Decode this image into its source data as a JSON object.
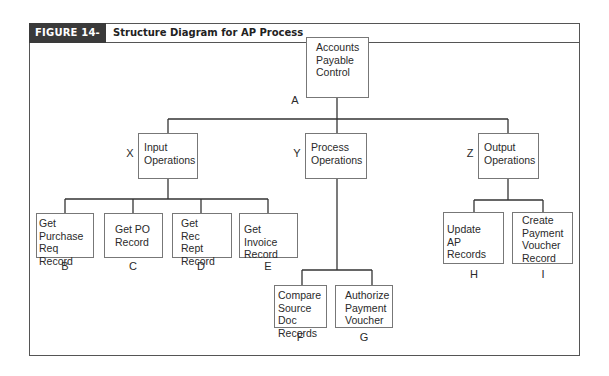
{
  "figure": {
    "label": "FIGURE 14-17",
    "title": "Structure Diagram for AP Process"
  },
  "nodes": {
    "A": {
      "letter": "A",
      "lines": [
        "Accounts",
        "Payable",
        "Control"
      ]
    },
    "X": {
      "letter": "X",
      "lines": [
        "Input",
        "Operations"
      ]
    },
    "Y": {
      "letter": "Y",
      "lines": [
        "Process",
        "Operations"
      ]
    },
    "Z": {
      "letter": "Z",
      "lines": [
        "Output",
        "Operations"
      ]
    },
    "B": {
      "letter": "B",
      "lines": [
        "Get",
        "Purchase",
        "Req Record"
      ]
    },
    "C": {
      "letter": "C",
      "lines": [
        "Get PO",
        "Record"
      ]
    },
    "D": {
      "letter": "D",
      "lines": [
        "Get",
        "Rec Rept",
        "Record"
      ]
    },
    "E": {
      "letter": "E",
      "lines": [
        "Get Invoice",
        "Record"
      ]
    },
    "F": {
      "letter": "F",
      "lines": [
        "Compare",
        "Source Doc",
        "Records"
      ]
    },
    "G": {
      "letter": "G",
      "lines": [
        "Authorize",
        "Payment",
        "Voucher"
      ]
    },
    "H": {
      "letter": "H",
      "lines": [
        "Update",
        "AP Records"
      ]
    },
    "I": {
      "letter": "I",
      "lines": [
        "Create",
        "Payment",
        "Voucher",
        "Record"
      ]
    }
  },
  "edges": [
    [
      "A",
      "X"
    ],
    [
      "A",
      "Y"
    ],
    [
      "A",
      "Z"
    ],
    [
      "X",
      "B"
    ],
    [
      "X",
      "C"
    ],
    [
      "X",
      "D"
    ],
    [
      "X",
      "E"
    ],
    [
      "Y",
      "F"
    ],
    [
      "Y",
      "G"
    ],
    [
      "Z",
      "H"
    ],
    [
      "Z",
      "I"
    ]
  ]
}
